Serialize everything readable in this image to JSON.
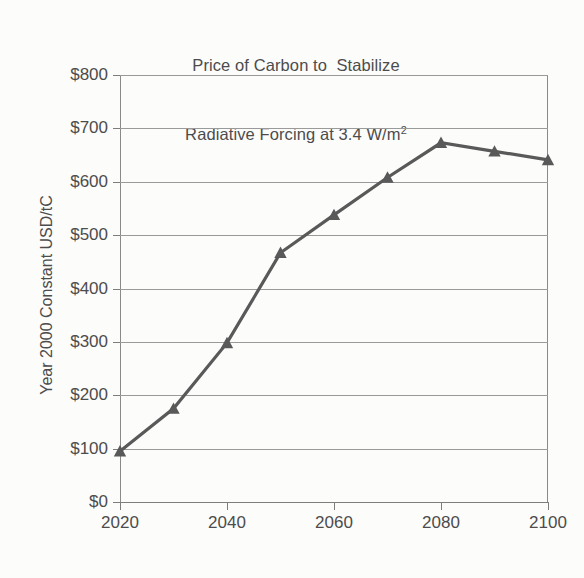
{
  "chart_data": {
    "type": "line",
    "title": "Price of Carbon to  Stabilize Radiative Forcing at 3.4 W/m2",
    "title_line1": "Price of Carbon to  Stabilize",
    "title_line2_pre": "Radiative Forcing at 3.4 W/m",
    "title_line2_sup": "2",
    "xlabel": "",
    "ylabel": "Year 2000 Constant USD/tC",
    "xlim": [
      2020,
      2100
    ],
    "ylim": [
      0,
      800
    ],
    "grid": true,
    "legend": false,
    "marker": "triangle",
    "series_color": "#595959",
    "gridline_color": "#9a9a9a",
    "x": [
      2020,
      2030,
      2040,
      2050,
      2060,
      2070,
      2080,
      2090,
      2100
    ],
    "values": [
      95,
      175,
      298,
      467,
      538,
      608,
      673,
      657,
      641
    ],
    "series": [
      {
        "name": "Carbon price",
        "values": [
          95,
          175,
          298,
          467,
          538,
          608,
          673,
          657,
          641
        ]
      }
    ],
    "y_ticks": [
      0,
      100,
      200,
      300,
      400,
      500,
      600,
      700,
      800
    ],
    "y_tick_labels": [
      "$0",
      "$100",
      "$200",
      "$300",
      "$400",
      "$500",
      "$600",
      "$700",
      "$800"
    ],
    "x_ticks": [
      2020,
      2040,
      2060,
      2080,
      2100
    ],
    "x_tick_labels": [
      "2020",
      "2040",
      "2060",
      "2080",
      "2100"
    ]
  }
}
